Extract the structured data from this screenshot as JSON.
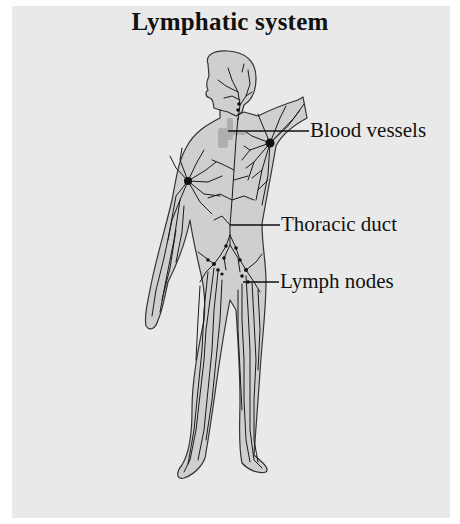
{
  "diagram": {
    "title": "Lymphatic system",
    "labels": [
      {
        "id": "blood-vessels",
        "text": "Blood vessels"
      },
      {
        "id": "thoracic-duct",
        "text": "Thoracic duct"
      },
      {
        "id": "lymph-nodes",
        "text": "Lymph nodes"
      }
    ],
    "colors": {
      "background": "#e9e9e9",
      "body_fill": "#cfcfcf",
      "vessel_stroke": "#1a1a1a",
      "blood_vessel_highlight": "#a9a9a9"
    }
  }
}
